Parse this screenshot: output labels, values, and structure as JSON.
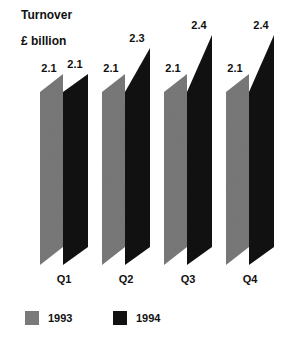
{
  "title": "Turnover",
  "unit": "£ billion",
  "colors": {
    "1993": "#7a7a7a",
    "1994": "#111111"
  },
  "legend": [
    {
      "label": "1993",
      "color": "#7a7a7a"
    },
    {
      "label": "1994",
      "color": "#111111"
    }
  ],
  "chart_data": {
    "type": "bar",
    "title": "Turnover",
    "ylabel": "£ billion",
    "xlabel": "",
    "categories": [
      "Q1",
      "Q2",
      "Q3",
      "Q4"
    ],
    "series": [
      {
        "name": "1993",
        "values": [
          2.1,
          2.1,
          2.1,
          2.1
        ]
      },
      {
        "name": "1994",
        "values": [
          2.1,
          2.3,
          2.4,
          2.4
        ]
      }
    ],
    "value_labels": {
      "1993": [
        "2.1",
        "2.1",
        "2.1",
        "2.1"
      ],
      "1994": [
        "2.1",
        "2.3",
        "2.4",
        "2.4"
      ]
    },
    "grid": false,
    "legend_position": "bottom",
    "style": "slanted 3D-like parallelogram bars"
  }
}
